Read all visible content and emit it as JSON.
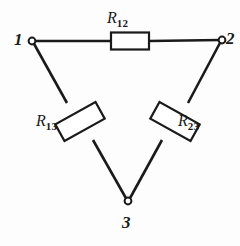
{
  "figure": {
    "background_color": "#fdfdfd",
    "ink_color": "#1a1a1a",
    "width": 240,
    "height": 246
  },
  "nodes": [
    {
      "id": "1",
      "label": "1",
      "x": 32,
      "y": 41,
      "terminal": "open-circle"
    },
    {
      "id": "2",
      "label": "2",
      "x": 222,
      "y": 40,
      "terminal": "open-circle"
    },
    {
      "id": "3",
      "label": "3",
      "x": 128,
      "y": 201,
      "terminal": "open-circle"
    }
  ],
  "resistors": [
    {
      "id": "R12",
      "symbol": "R",
      "subscript": "12",
      "between": [
        "1",
        "2"
      ],
      "orientation": "horizontal",
      "center_x": 130,
      "center_y": 41,
      "box_length": 38,
      "box_width": 16,
      "angle_deg": 0
    },
    {
      "id": "R13",
      "symbol": "R",
      "subscript": "13",
      "between": [
        "1",
        "3"
      ],
      "orientation": "diagonal-left",
      "center_x": 80,
      "center_y": 121,
      "box_length": 46,
      "box_width": 19,
      "angle_deg": 58
    },
    {
      "id": "R23",
      "symbol": "R",
      "subscript": "23",
      "between": [
        "2",
        "3"
      ],
      "orientation": "diagonal-right",
      "center_x": 175,
      "center_y": 121,
      "box_length": 46,
      "box_width": 19,
      "angle_deg": -58
    }
  ],
  "wires": [
    {
      "name": "wire-1-2",
      "from": "1",
      "to": "2"
    },
    {
      "name": "wire-1-3",
      "from": "1",
      "to": "3"
    },
    {
      "name": "wire-2-3",
      "from": "2",
      "to": "3"
    }
  ]
}
